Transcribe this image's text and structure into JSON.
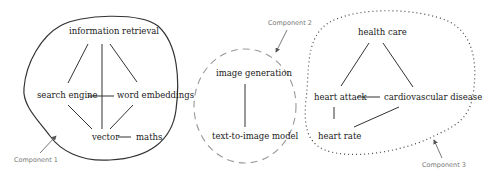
{
  "components": [
    {
      "label": "Component 1",
      "border": "solid",
      "nodes": [
        "information retrieval",
        "search engine",
        "word embeddings",
        "vector",
        "maths"
      ],
      "edges": [
        [
          "information retrieval",
          "search engine"
        ],
        [
          "information retrieval",
          "word embeddings"
        ],
        [
          "information retrieval",
          "vector"
        ],
        [
          "search engine",
          "word embeddings"
        ],
        [
          "search engine",
          "vector"
        ],
        [
          "word embeddings",
          "vector"
        ],
        [
          "vector",
          "maths"
        ]
      ]
    },
    {
      "label": "Component 2",
      "border": "dashed",
      "nodes": [
        "image generation",
        "text-to-image model"
      ],
      "edges": [
        [
          "image generation",
          "text-to-image model"
        ]
      ]
    },
    {
      "label": "Component 3",
      "border": "dotted",
      "nodes": [
        "health care",
        "heart attack",
        "cardiovascular disease",
        "heart rate"
      ],
      "edges": [
        [
          "health care",
          "heart attack"
        ],
        [
          "health care",
          "cardiovascular disease"
        ],
        [
          "heart attack",
          "cardiovascular disease"
        ],
        [
          "heart attack",
          "heart rate"
        ],
        [
          "cardiovascular disease",
          "heart rate"
        ]
      ]
    }
  ]
}
